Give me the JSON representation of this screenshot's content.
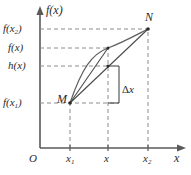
{
  "figure": {
    "axes": {
      "y_axis_label": "f(x)",
      "x_axis_label": "x",
      "origin_label": "O"
    },
    "y_ticks": [
      {
        "id": "fx2",
        "text": "f(x",
        "sub": "2",
        "close": ")",
        "y_px": 29
      },
      {
        "id": "fx",
        "text": "f(x",
        "sub": "",
        "close": ")",
        "y_px": 48
      },
      {
        "id": "hx",
        "text": "h(x",
        "sub": "",
        "close": ")",
        "y_px": 66
      },
      {
        "id": "fx1",
        "text": "f(x",
        "sub": "1",
        "close": ")",
        "y_px": 103
      }
    ],
    "x_ticks": [
      {
        "id": "x1",
        "text": "x",
        "sub": "1",
        "x_px": 70
      },
      {
        "id": "x",
        "text": "x",
        "sub": "",
        "x_px": 108
      },
      {
        "id": "x2",
        "text": "x",
        "sub": "2",
        "x_px": 148
      }
    ],
    "points": [
      {
        "id": "M",
        "label": "M",
        "x_px": 70,
        "y_px": 103
      },
      {
        "id": "N",
        "label": "N",
        "x_px": 148,
        "y_px": 29
      }
    ],
    "annotations": [
      {
        "id": "delta-x",
        "label": "Δx",
        "symbol": "Δ",
        "variable": "x"
      }
    ],
    "colors": {
      "axis": "#5a5a5a",
      "curve": "#5f5f5f",
      "chord": "#4a4a4a",
      "dashed": "#8c8c8c",
      "text": "#2b2b2b",
      "background": "#ffffff"
    }
  }
}
